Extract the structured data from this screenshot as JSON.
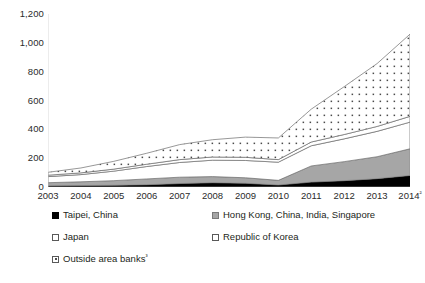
{
  "chart_data": {
    "type": "area",
    "stacked": true,
    "title": "",
    "xlabel": "",
    "ylabel": "",
    "ylim": [
      0,
      1200
    ],
    "ytick_values": [
      0,
      200,
      400,
      600,
      800,
      1000,
      1200
    ],
    "ytick_labels": [
      "0",
      "200",
      "400",
      "600",
      "800",
      "1,000",
      "1,200"
    ],
    "grid": false,
    "legend_position": "below",
    "categories": [
      "2003",
      "2004",
      "2005",
      "2006",
      "2007",
      "2008",
      "2009",
      "2010",
      "2011",
      "2012",
      "2013",
      "2014"
    ],
    "category_labels": [
      "2003",
      "2004",
      "2005",
      "2006",
      "2007",
      "2008",
      "2009",
      "2010",
      "2011",
      "2012",
      "2013",
      "2014²"
    ],
    "series": [
      {
        "name": "Taipei, China",
        "fill": "solid-black",
        "color": "#000000",
        "values": [
          8,
          10,
          12,
          16,
          24,
          30,
          26,
          14,
          34,
          44,
          58,
          80
        ]
      },
      {
        "name": "Hong Kong, China, India, Singapore",
        "fill": "gray",
        "color": "#a6a6a6",
        "values": [
          22,
          26,
          32,
          40,
          44,
          42,
          38,
          32,
          112,
          132,
          152,
          185
        ]
      },
      {
        "name": "Japan",
        "fill": "white",
        "color": "#ffffff",
        "values": [
          42,
          50,
          66,
          86,
          102,
          114,
          120,
          126,
          140,
          158,
          176,
          185
        ]
      },
      {
        "name": "Republic of Korea",
        "fill": "white",
        "color": "#ffffff",
        "values": [
          10,
          12,
          14,
          16,
          20,
          22,
          22,
          18,
          26,
          30,
          34,
          40
        ]
      },
      {
        "name": "Outside area banks³",
        "fill": "dotted",
        "color": "#ffffff",
        "values": [
          20,
          34,
          54,
          76,
          104,
          120,
          140,
          150,
          228,
          332,
          436,
          570
        ]
      }
    ],
    "totals": [
      102,
      132,
      178,
      234,
      294,
      328,
      346,
      340,
      540,
      696,
      856,
      1060
    ]
  },
  "legend": {
    "rows": [
      {
        "left": {
          "label": "Taipei, China",
          "swatch": "solid-black"
        },
        "right": {
          "label": "Hong Kong, China, India, Singapore",
          "swatch": "gray"
        }
      },
      {
        "left": {
          "label": "Japan",
          "swatch": "white"
        },
        "right": {
          "label": "Republic of Korea",
          "swatch": "white"
        }
      },
      {
        "left": {
          "label": "Outside area banks³",
          "swatch": "dotted"
        },
        "right": null
      }
    ]
  }
}
